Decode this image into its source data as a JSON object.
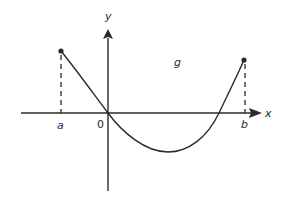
{
  "diagram": {
    "function_label": "g",
    "axes": {
      "x_label": "x",
      "y_label": "y",
      "origin_label": "0"
    },
    "points": [
      {
        "label": "a",
        "note": "left endpoint of interval, filled dot on curve above x-axis"
      },
      {
        "label": "b",
        "note": "right endpoint of interval, filled dot on curve above x-axis"
      }
    ],
    "colors": {
      "line": "#2a2a2a",
      "background": "#ffffff"
    }
  }
}
